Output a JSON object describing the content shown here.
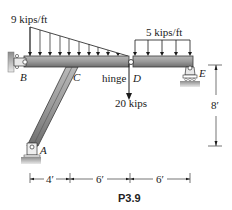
{
  "figure": {
    "caption": "P3.9",
    "loads": {
      "triangular": "9 kips/ft",
      "uniform": "5 kips/ft",
      "point": "20 kips"
    },
    "points": {
      "A": "A",
      "B": "B",
      "C": "C",
      "D": "D",
      "E": "E"
    },
    "hinge_label": "hinge",
    "dimensions": {
      "horizontal": [
        "4′",
        "6′",
        "6′"
      ],
      "vertical": "8′"
    },
    "colors": {
      "member": "#8a8a8a",
      "member_dark": "#4a4a4a",
      "ground": "#9a9a9a",
      "line": "#1a1a1a"
    }
  }
}
